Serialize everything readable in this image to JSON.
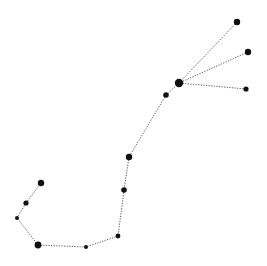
{
  "diagram": {
    "type": "constellation",
    "background": "#ffffff",
    "line_color": "#555555",
    "star_color": "#111111",
    "stars": [
      {
        "id": "s1",
        "x": 237,
        "y": 22,
        "r": 3.2
      },
      {
        "id": "s2",
        "x": 248,
        "y": 52,
        "r": 3.2
      },
      {
        "id": "s3",
        "x": 179,
        "y": 83,
        "r": 4.2
      },
      {
        "id": "s4",
        "x": 246,
        "y": 89,
        "r": 2.6
      },
      {
        "id": "s5",
        "x": 166,
        "y": 95,
        "r": 2.8
      },
      {
        "id": "s6",
        "x": 129,
        "y": 157,
        "r": 3.2
      },
      {
        "id": "s7",
        "x": 124,
        "y": 190,
        "r": 2.8
      },
      {
        "id": "s8",
        "x": 118,
        "y": 236,
        "r": 2.4
      },
      {
        "id": "s9",
        "x": 86,
        "y": 247,
        "r": 2.0
      },
      {
        "id": "s10",
        "x": 38,
        "y": 245,
        "r": 3.4
      },
      {
        "id": "s11",
        "x": 17,
        "y": 218,
        "r": 2.0
      },
      {
        "id": "s12",
        "x": 26,
        "y": 203,
        "r": 2.6
      },
      {
        "id": "s13",
        "x": 41,
        "y": 183,
        "r": 3.2
      }
    ],
    "edges": [
      [
        "s1",
        "s3"
      ],
      [
        "s2",
        "s3"
      ],
      [
        "s4",
        "s3"
      ],
      [
        "s3",
        "s5"
      ],
      [
        "s5",
        "s6"
      ],
      [
        "s6",
        "s7"
      ],
      [
        "s7",
        "s8"
      ],
      [
        "s8",
        "s9"
      ],
      [
        "s9",
        "s10"
      ],
      [
        "s10",
        "s11"
      ],
      [
        "s11",
        "s12"
      ],
      [
        "s12",
        "s13"
      ]
    ]
  }
}
